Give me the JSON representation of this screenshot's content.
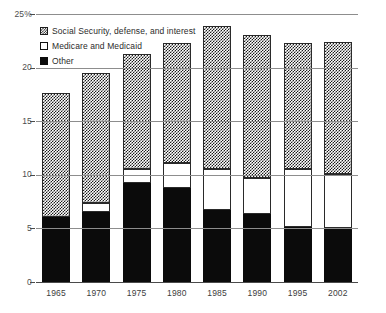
{
  "chart_data": {
    "type": "bar",
    "subtype": "stacked",
    "title": "",
    "xlabel": "",
    "ylabel": "",
    "ylim": [
      0,
      25
    ],
    "yticks": [
      "0",
      "5",
      "10",
      "15",
      "20",
      "25%"
    ],
    "ytick_values": [
      0,
      5,
      10,
      15,
      20,
      25
    ],
    "grid": true,
    "legend_position": "top-left",
    "categories": [
      "1965",
      "1970",
      "1975",
      "1980",
      "1985",
      "1990",
      "1995",
      "2002"
    ],
    "series": [
      {
        "name": "Other",
        "swatch": "solid-black",
        "color": "#0b0b0b",
        "values": [
          6.1,
          6.5,
          9.2,
          8.8,
          6.7,
          6.3,
          5.1,
          5.0
        ]
      },
      {
        "name": "Medicare and Medicaid",
        "swatch": "white-outline",
        "color": "#ffffff",
        "values": [
          0.0,
          0.9,
          1.3,
          2.3,
          3.8,
          3.4,
          5.4,
          5.1
        ]
      },
      {
        "name": "Social Security, defense, and interest",
        "swatch": "checkered",
        "color": "#1b1b1b",
        "values": [
          11.5,
          12.1,
          10.8,
          11.2,
          13.4,
          13.3,
          11.8,
          12.3
        ]
      }
    ],
    "totals": [
      17.6,
      19.5,
      21.3,
      22.3,
      23.9,
      23.0,
      22.3,
      22.4
    ]
  },
  "legend": {
    "items": [
      {
        "label": "Social Security, defense, and interest",
        "swatch": "checkered"
      },
      {
        "label": "Medicare and Medicaid",
        "swatch": "white-outline"
      },
      {
        "label": "Other",
        "swatch": "solid-black"
      }
    ]
  },
  "colors": {
    "gridline": "#8d8d8d",
    "axis": "#4a4a4a",
    "text": "#3d3d3d",
    "bar_dark": "#0b0b0b",
    "bar_light": "#ffffff"
  }
}
